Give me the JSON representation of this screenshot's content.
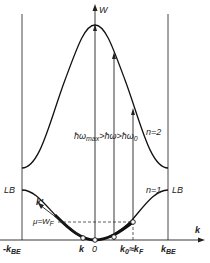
{
  "diagram": {
    "type": "band-structure",
    "axes": {
      "y_label": "W",
      "x_label": "k"
    },
    "curves": [
      {
        "name": "n=2",
        "label": "n=2"
      },
      {
        "name": "n=1",
        "label": "n=1"
      }
    ],
    "labels": {
      "lb_left": "LB",
      "lb_right": "LB",
      "k_prime": "k'",
      "mu": "μ=W",
      "mu_sub": "F",
      "k_point": "k",
      "origin": "0",
      "k0_main": "k",
      "k0_sub": "0",
      "k0_eq": "≈k",
      "k0_f_sub": "F",
      "neg_kbe": "-k",
      "neg_kbe_sub": "BE",
      "kbe": "k",
      "kbe_sub": "BE",
      "omega_condition": "ħω",
      "omega_max_sub": "max",
      "omega_mid": ">ħω>ħω",
      "omega_0_sub": "0"
    },
    "colors": {
      "line": "#1a1a1a",
      "background": "#ffffff"
    }
  }
}
